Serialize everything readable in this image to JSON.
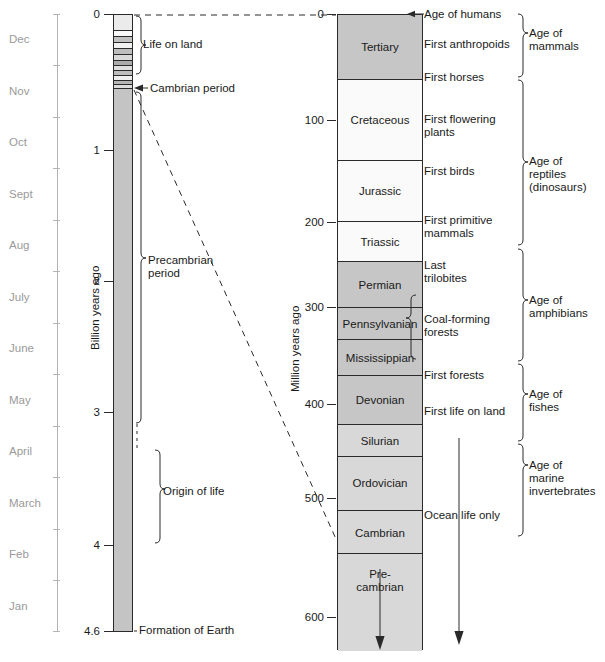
{
  "calendar_axis": {
    "name": "calendar-months",
    "months": [
      "Dec",
      "Nov",
      "Oct",
      "Sept",
      "Aug",
      "July",
      "June",
      "May",
      "April",
      "March",
      "Feb",
      "Jan"
    ]
  },
  "billion_axis": {
    "label": "Billion years ago",
    "ticks": [
      "0",
      "1",
      "2",
      "3",
      "4",
      "4.6"
    ]
  },
  "million_axis": {
    "label": "Million years ago",
    "ticks": [
      "0",
      "100",
      "200",
      "300",
      "400",
      "500",
      "600"
    ]
  },
  "earth_column": {
    "annotations": {
      "life_on_land": "Life on land",
      "cambrian_period": "Cambrian period",
      "precambrian_period": "Precambrian\nperiod",
      "origin_of_life": "Origin of life",
      "formation_of_earth": "Formation of Earth"
    }
  },
  "geologic_column": {
    "periods": [
      {
        "name": "Tertiary",
        "shade": "dark"
      },
      {
        "name": "Cretaceous",
        "shade": "light"
      },
      {
        "name": "Jurassic",
        "shade": "light"
      },
      {
        "name": "Triassic",
        "shade": "light"
      },
      {
        "name": "Permian",
        "shade": "dark"
      },
      {
        "name": "Pennsylvanian",
        "shade": "dark"
      },
      {
        "name": "Mississippian",
        "shade": "dark"
      },
      {
        "name": "Devonian",
        "shade": "dark"
      },
      {
        "name": "Silurian",
        "shade": "mid"
      },
      {
        "name": "Ordovician",
        "shade": "mid"
      },
      {
        "name": "Cambrian",
        "shade": "mid"
      },
      {
        "name": "Pre-\ncambrian",
        "shade": "mid"
      }
    ]
  },
  "events": {
    "age_of_humans": "Age of humans",
    "first_anthropoids": "First anthropoids",
    "first_horses": "First horses",
    "first_flowering_plants": "First flowering\nplants",
    "first_birds": "First birds",
    "first_primitive_mammals": "First primitive\nmammals",
    "last_trilobites": "Last\ntrilobites",
    "coal_forming_forests": "Coal-forming\nforests",
    "first_forests": "First forests",
    "first_life_on_land": "First life on land",
    "ocean_life_only": "Ocean life only"
  },
  "ages": {
    "age_of_mammals": "Age of\nmammals",
    "age_of_reptiles": "Age of\nreptiles\n(dinosaurs)",
    "age_of_amphibians": "Age of\namphibians",
    "age_of_fishes": "Age of\nfishes",
    "age_of_marine_invertebrates": "Age of\nmarine\ninvertebrates"
  },
  "colors": {
    "dark_gray": "#c6c6c6",
    "mid_gray": "#d6d6d6",
    "light_gray": "#fafafa",
    "earth_bar": "#c4c4c4",
    "stroke": "#2a2a2a",
    "month_text": "#9a9a9a"
  }
}
